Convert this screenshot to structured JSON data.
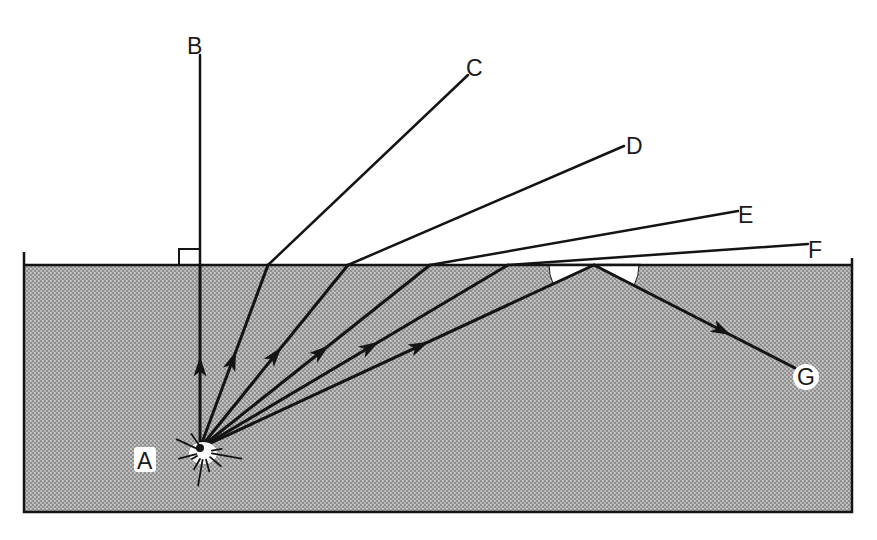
{
  "diagram": {
    "type": "refraction-total-internal-reflection",
    "canvas": {
      "width": 877,
      "height": 540
    },
    "colors": {
      "background": "#ffffff",
      "water_fill": "#b9b9b9",
      "water_dot_dark": "#8f8f8f",
      "water_dot_light": "#d6d6d6",
      "line": "#141414",
      "tir_wedge": "#ffffff",
      "flash": "#ffffff"
    },
    "tank": {
      "left": 24,
      "right": 852,
      "surface_y": 265,
      "bottom_y": 512,
      "wall_top_left": 252,
      "wall_top_right": 258
    },
    "source": {
      "label": "A",
      "x": 200,
      "y": 448,
      "label_x": 145,
      "label_y": 461
    },
    "normal_marker": {
      "x": 179,
      "y": 249,
      "size": 18
    },
    "rays": [
      {
        "id": "B",
        "label": "B",
        "surface_x": 200,
        "end": [
          200,
          55
        ],
        "label_pos": [
          194,
          46
        ],
        "arrow_t": 0.5
      },
      {
        "id": "C",
        "label": "C",
        "surface_x": 268,
        "end": [
          468,
          75
        ],
        "label_pos": [
          473,
          68
        ],
        "arrow_t": 0.53
      },
      {
        "id": "D",
        "label": "D",
        "surface_x": 348,
        "end": [
          624,
          146
        ],
        "label_pos": [
          633,
          146
        ],
        "arrow_t": 0.55
      },
      {
        "id": "E",
        "label": "E",
        "surface_x": 430,
        "end": [
          738,
          211
        ],
        "label_pos": [
          745,
          215
        ],
        "arrow_t": 0.56
      },
      {
        "id": "F",
        "label": "F",
        "surface_x": 508,
        "end": [
          808,
          244
        ],
        "label_pos": [
          815,
          250
        ],
        "arrow_t": 0.58
      }
    ],
    "reflected_ray": {
      "label": "G",
      "surface_x": 594,
      "end": [
        795,
        368
      ],
      "label_pos": [
        797,
        385
      ],
      "arrow_in_t": 0.58,
      "arrow_out_t": 0.68
    },
    "critical_angle_arcs": {
      "center_x": 594,
      "radius": 45
    }
  }
}
